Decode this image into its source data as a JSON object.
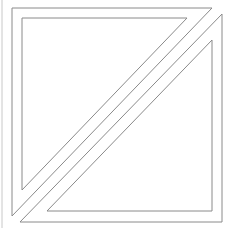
{
  "diagram": {
    "stroke_color": "#8a8a8a",
    "stroke_width": 1,
    "background": "#ffffff",
    "edge_line": {
      "x": 2,
      "y1": 0,
      "y2": 228
    },
    "upper_left_outer": "12,8 212,8 12,216",
    "upper_left_inner": "22,18 187,18 22,190",
    "lower_right_outer": "222,14 222,222 20,222",
    "lower_right_inner": "212,40 212,211 47,211"
  }
}
